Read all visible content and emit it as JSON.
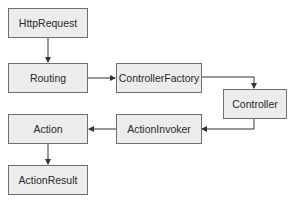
{
  "diagram": {
    "type": "flowchart",
    "nodes": [
      {
        "id": "httprequest",
        "label": "HttpRequest"
      },
      {
        "id": "routing",
        "label": "Routing"
      },
      {
        "id": "controllerfactory",
        "label": "ControllerFactory"
      },
      {
        "id": "controller",
        "label": "Controller"
      },
      {
        "id": "actioninvoker",
        "label": "ActionInvoker"
      },
      {
        "id": "action",
        "label": "Action"
      },
      {
        "id": "actionresult",
        "label": "ActionResult"
      }
    ],
    "edges": [
      {
        "from": "httprequest",
        "to": "routing"
      },
      {
        "from": "routing",
        "to": "controllerfactory"
      },
      {
        "from": "controllerfactory",
        "to": "controller"
      },
      {
        "from": "controller",
        "to": "actioninvoker"
      },
      {
        "from": "actioninvoker",
        "to": "action"
      },
      {
        "from": "action",
        "to": "actionresult"
      }
    ],
    "colors": {
      "node_fill": "#ececec",
      "node_border": "#6f6f6f",
      "edge": "#333333",
      "text": "#2a2a2a"
    }
  }
}
